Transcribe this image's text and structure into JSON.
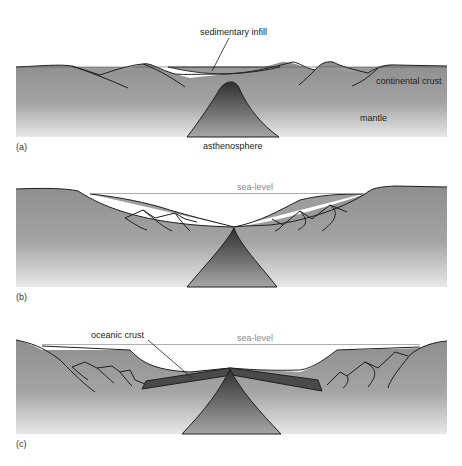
{
  "figure": {
    "panels": [
      {
        "id": "a",
        "label": "(a)",
        "annotations": {
          "sedimentary_infill": "sedimentary infill",
          "continental_crust": "continental crust",
          "mantle": "mantle",
          "asthenosphere": "asthenosphere"
        }
      },
      {
        "id": "b",
        "label": "(b)",
        "annotations": {
          "sea_level": "sea-level"
        }
      },
      {
        "id": "c",
        "label": "(c)",
        "annotations": {
          "oceanic_crust": "oceanic crust",
          "sea_level": "sea-level"
        }
      }
    ],
    "colors": {
      "crust_top": "#8e8e8e",
      "crust_bottom": "#e6e6e6",
      "sediment": "#9e9e9e",
      "asthenosphere_top": "#3a3a3a",
      "asthenosphere_bottom": "#a0a0a0",
      "oceanic_crust": "#4a4a4a",
      "outline": "#1e1e1e",
      "sea_level_line": "#999999"
    }
  }
}
